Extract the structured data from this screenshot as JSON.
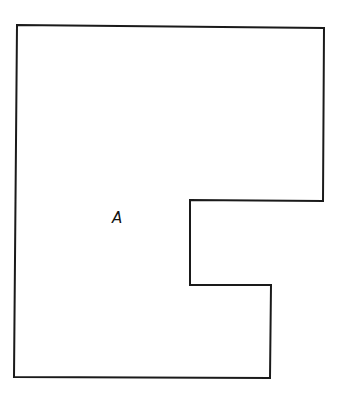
{
  "diagram": {
    "type": "polygon-region",
    "stroke_color": "#1a1a1a",
    "fill_color": "#ffffff",
    "stroke_width": 2,
    "vertices": [
      [
        17,
        25
      ],
      [
        324,
        28
      ],
      [
        323,
        201
      ],
      [
        190,
        200
      ],
      [
        190,
        285
      ],
      [
        271,
        285
      ],
      [
        270,
        378
      ],
      [
        14,
        377
      ]
    ],
    "label": {
      "text": "A",
      "x": 112,
      "y": 223
    }
  }
}
